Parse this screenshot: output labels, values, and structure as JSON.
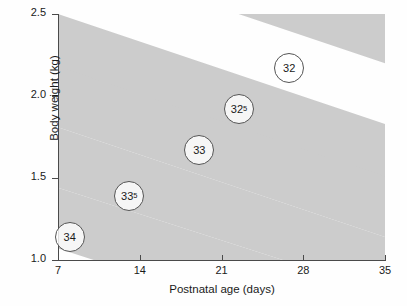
{
  "chart_data": {
    "type": "area",
    "title": "",
    "xlabel": "Postnatal age (days)",
    "ylabel": "Body weight (kg)",
    "xlim": [
      7,
      35
    ],
    "ylim": [
      1.0,
      2.5
    ],
    "xticks": [
      "7",
      "14",
      "21",
      "28",
      "35"
    ],
    "yticks": [
      "1.0",
      "1.5",
      "2.0",
      "2.5"
    ],
    "grid": false,
    "legend_position": "none",
    "band_color": "#cccccc",
    "axis_color": "#4a4a4a",
    "series": [
      {
        "name": "32",
        "label": "32",
        "sup": "",
        "label_x": 26.8,
        "label_y": 2.17,
        "lower_at_x7": 2.87,
        "lower_at_x35": 2.2,
        "upper_at_x7": 3.24,
        "upper_at_x35": 2.57
      },
      {
        "name": "32-5",
        "label": "32",
        "sup": "5",
        "label_x": 22.5,
        "label_y": 1.92,
        "lower_at_x7": 2.13,
        "lower_at_x35": 1.46,
        "upper_at_x7": 2.5,
        "upper_at_x35": 1.83
      },
      {
        "name": "33",
        "label": "33",
        "sup": "",
        "label_x": 19.1,
        "label_y": 1.67,
        "lower_at_x7": 1.81,
        "lower_at_x35": 1.14,
        "upper_at_x7": 2.18,
        "upper_at_x35": 1.51
      },
      {
        "name": "33-5",
        "label": "33",
        "sup": "5",
        "label_x": 13.1,
        "label_y": 1.39,
        "lower_at_x7": 1.44,
        "lower_at_x35": 0.8,
        "upper_at_x7": 1.81,
        "upper_at_x35": 1.14
      },
      {
        "name": "34",
        "label": "34",
        "sup": "",
        "label_x": 8.0,
        "label_y": 1.14,
        "lower_at_x7": 1.07,
        "lower_at_x35": 0.43,
        "upper_at_x7": 1.44,
        "upper_at_x35": 0.8
      }
    ]
  }
}
